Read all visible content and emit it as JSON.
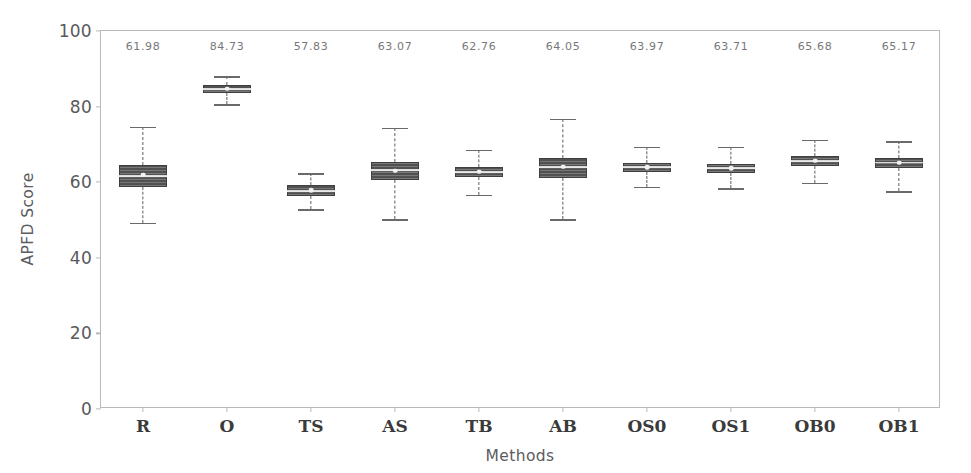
{
  "chart_data": {
    "type": "box",
    "title": "",
    "xlabel": "Methods",
    "ylabel": "APFD Score",
    "ylim": [
      0,
      100
    ],
    "yticks": [
      0,
      20,
      40,
      60,
      80,
      100
    ],
    "ytick_labels": [
      "0",
      "20",
      "40",
      "60",
      "80",
      "100"
    ],
    "grid": false,
    "legend": null,
    "categories": [
      "R",
      "O",
      "TS",
      "AS",
      "TB",
      "AB",
      "OS0",
      "OS1",
      "OB0",
      "OB1"
    ],
    "annotation_values": [
      "61.98",
      "84.73",
      "57.83",
      "63.07",
      "62.76",
      "64.05",
      "63.97",
      "63.71",
      "65.68",
      "65.17"
    ],
    "annotation_position": "top-inside-axes",
    "box_color": "#5a5a5a",
    "box_edge_color": "#3f3f3f",
    "median_color": "#e9e9e9",
    "whisker_color": "#5e5e5e",
    "axis_color": "#b9b9b9",
    "boxes": [
      {
        "category": "R",
        "mean": 61.98,
        "median": 61.6,
        "q1": 58.6,
        "q3": 64.6,
        "whisker_low": 49.2,
        "whisker_high": 74.6,
        "fliers": []
      },
      {
        "category": "O",
        "mean": 84.73,
        "median": 84.6,
        "q1": 83.6,
        "q3": 85.6,
        "whisker_low": 80.6,
        "whisker_high": 88.0,
        "fliers": []
      },
      {
        "category": "TS",
        "mean": 57.83,
        "median": 57.7,
        "q1": 56.4,
        "q3": 59.2,
        "whisker_low": 52.8,
        "whisker_high": 62.4,
        "fliers": []
      },
      {
        "category": "AS",
        "mean": 63.07,
        "median": 63.1,
        "q1": 60.7,
        "q3": 65.4,
        "whisker_low": 50.2,
        "whisker_high": 74.4,
        "fliers": []
      },
      {
        "category": "TB",
        "mean": 62.76,
        "median": 62.7,
        "q1": 61.4,
        "q3": 64.0,
        "whisker_low": 56.6,
        "whisker_high": 68.6,
        "fliers": []
      },
      {
        "category": "AB",
        "mean": 64.05,
        "median": 63.9,
        "q1": 61.0,
        "q3": 66.4,
        "whisker_low": 50.2,
        "whisker_high": 76.8,
        "fliers": []
      },
      {
        "category": "OS0",
        "mean": 63.97,
        "median": 63.9,
        "q1": 62.6,
        "q3": 65.1,
        "whisker_low": 58.8,
        "whisker_high": 69.4,
        "fliers": []
      },
      {
        "category": "OS1",
        "mean": 63.71,
        "median": 63.7,
        "q1": 62.4,
        "q3": 64.9,
        "whisker_low": 58.4,
        "whisker_high": 69.4,
        "fliers": []
      },
      {
        "category": "OB0",
        "mean": 65.68,
        "median": 65.6,
        "q1": 64.4,
        "q3": 66.9,
        "whisker_low": 59.8,
        "whisker_high": 71.2,
        "fliers": []
      },
      {
        "category": "OB1",
        "mean": 65.17,
        "median": 65.2,
        "q1": 63.8,
        "q3": 66.5,
        "whisker_low": 57.6,
        "whisker_high": 70.8,
        "fliers": []
      }
    ]
  }
}
